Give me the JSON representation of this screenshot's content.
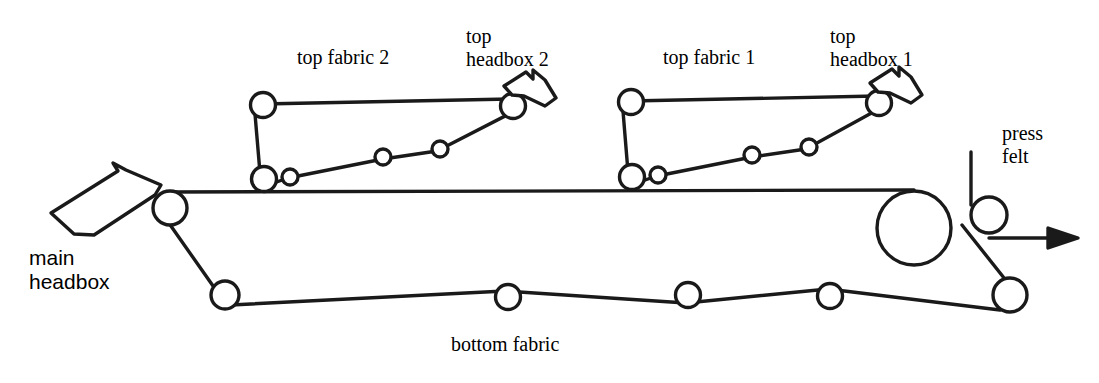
{
  "diagram": {
    "background_color": "#ffffff",
    "line_color": "#1a1a1a",
    "labels": {
      "top_fabric_2": "top fabric 2",
      "top_headbox_2": "top\nheadbox 2",
      "top_fabric_1": "top fabric 1",
      "top_headbox_1": "top\nheadbox 1",
      "press_felt": "press\nfelt",
      "main_headbox": "main\nheadbox",
      "bottom_fabric": "bottom fabric"
    },
    "components": {
      "main_headbox_nozzle": "bent-nozzle-shape",
      "top_headbox_1_nozzle": "bent-nozzle-shape",
      "top_headbox_2_nozzle": "bent-nozzle-shape",
      "top_fabric_1_loop": "closed-belt-loop",
      "top_fabric_2_loop": "closed-belt-loop",
      "bottom_fabric_loop": "closed-belt-loop",
      "press_felt_line": "vertical-line-into-nip",
      "sheet_run_arrow": "horizontal-arrow-right"
    },
    "roller_counts": {
      "top_fabric_1": 5,
      "top_fabric_2": 5,
      "bottom_fabric": 6,
      "press_felt": 1
    }
  }
}
